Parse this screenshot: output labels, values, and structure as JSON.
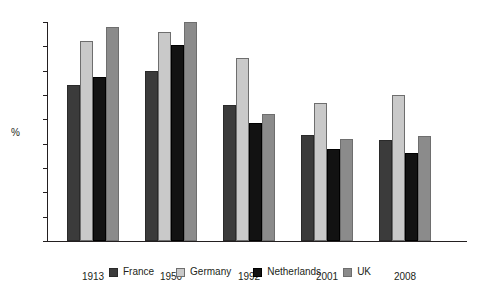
{
  "chart_data": {
    "type": "bar",
    "title": "",
    "subtitle": "",
    "xlabel": "",
    "ylabel": "%",
    "categories": [
      "1913",
      "1950",
      "1992",
      "2001",
      "2008"
    ],
    "series": [
      {
        "name": "France",
        "color": "#3b3b3b",
        "values": [
          32.1,
          35.0,
          28.0,
          21.8,
          20.7
        ]
      },
      {
        "name": "Germany",
        "color": "#c9c9c9",
        "values": [
          41.0,
          43.0,
          37.7,
          28.3,
          30.0
        ]
      },
      {
        "name": "Netherlands",
        "color": "#121212",
        "values": [
          33.7,
          40.3,
          24.3,
          19.0,
          18.0
        ]
      },
      {
        "name": "UK",
        "color": "#8b8b8b",
        "values": [
          44.0,
          45.0,
          26.0,
          21.0,
          21.5
        ]
      }
    ],
    "ylim": [
      0,
      45
    ],
    "yticks": [
      0,
      5,
      10,
      15,
      20,
      25,
      30,
      35,
      40,
      45
    ],
    "ytick_labels": [
      "0",
      "5",
      "10",
      "15",
      "20",
      "25",
      "30",
      "35",
      "40",
      "45"
    ],
    "grid": false,
    "legend_position": "bottom",
    "legend_entries": [
      "France",
      "Germany",
      "Netherlands",
      "UK"
    ]
  }
}
